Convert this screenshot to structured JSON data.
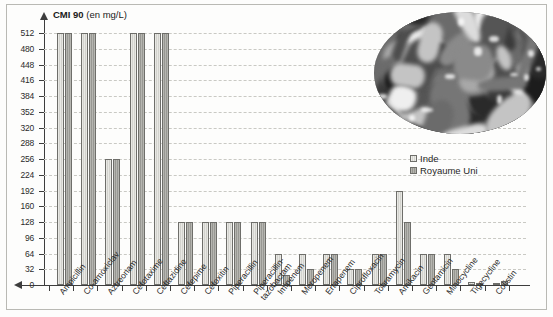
{
  "figure": {
    "axis_title_bold": "CMI 90",
    "axis_title_unit": "(en mg/L)",
    "photo_alt": "pills-photo"
  },
  "legend": {
    "position": "inside-right",
    "entries": [
      {
        "label": "Inde",
        "color": "#dcdcd7"
      },
      {
        "label": "Royaume Uni",
        "color": "#a6a6a1"
      }
    ]
  },
  "chart_data": {
    "type": "bar",
    "title": "CMI 90 (en mg/L)",
    "xlabel": "",
    "ylabel": "CMI 90 (en mg/L)",
    "ylim": [
      0,
      512
    ],
    "yticks": [
      0,
      32,
      64,
      96,
      128,
      160,
      192,
      224,
      256,
      288,
      320,
      352,
      384,
      416,
      448,
      480,
      512
    ],
    "grid": true,
    "categories": [
      "Ampicillin",
      "Co-amoxiclav",
      "Aztreonam",
      "Cefotaxime",
      "Ceftazidine",
      "Cefepime",
      "Cefoxitin",
      "Piperacillin",
      "Piperacillin-\ntazobactam",
      "Imipenem",
      "Meropenem",
      "Ertapenem",
      "Ciprofloxacin",
      "Tobramycin",
      "Amikacin",
      "Gentamicin",
      "Minocycline",
      "Tigecycline",
      "Colistin"
    ],
    "series": [
      {
        "name": "Inde",
        "color": "#dcdcd7",
        "values": [
          512,
          512,
          256,
          512,
          512,
          128,
          128,
          128,
          128,
          64,
          64,
          64,
          32,
          64,
          192,
          64,
          64,
          6,
          4
        ]
      },
      {
        "name": "Royaume Uni",
        "color": "#a6a6a1",
        "values": [
          512,
          512,
          256,
          512,
          512,
          128,
          128,
          128,
          128,
          20,
          32,
          64,
          32,
          64,
          128,
          64,
          32,
          4,
          8
        ]
      }
    ]
  }
}
